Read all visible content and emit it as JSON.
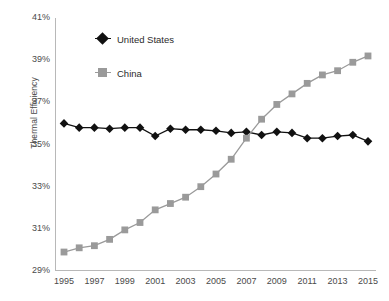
{
  "chart_data": {
    "type": "line",
    "title": "",
    "xlabel": "",
    "ylabel": "Thermal Efficiency",
    "x": [
      1995,
      1996,
      1997,
      1998,
      1999,
      2000,
      2001,
      2002,
      2003,
      2004,
      2005,
      2006,
      2007,
      2008,
      2009,
      2010,
      2011,
      2012,
      2013,
      2014,
      2015
    ],
    "xtick_labels": [
      "1995",
      "1997",
      "1999",
      "2001",
      "2003",
      "2005",
      "2007",
      "2009",
      "2011",
      "2013",
      "2015"
    ],
    "xtick_values": [
      1995,
      1997,
      1999,
      2001,
      2003,
      2005,
      2007,
      2009,
      2011,
      2013,
      2015
    ],
    "ytick_labels": [
      "29%",
      "31%",
      "33%",
      "35%",
      "37%",
      "39%",
      "41%"
    ],
    "ytick_values": [
      29,
      31,
      33,
      35,
      37,
      39,
      41
    ],
    "xlim": [
      1995,
      2015
    ],
    "ylim": [
      29,
      41
    ],
    "grid": false,
    "legend_position": "upper-left-inside",
    "series": [
      {
        "name": "United States",
        "marker": "diamond",
        "color": "#111111",
        "values": [
          36.0,
          35.8,
          35.8,
          35.75,
          35.8,
          35.8,
          35.4,
          35.75,
          35.7,
          35.7,
          35.65,
          35.55,
          35.6,
          35.45,
          35.6,
          35.55,
          35.3,
          35.3,
          35.4,
          35.45,
          35.15
        ]
      },
      {
        "name": "China",
        "marker": "square",
        "color": "#9a9a9a",
        "values": [
          29.9,
          30.1,
          30.2,
          30.5,
          30.95,
          31.3,
          31.9,
          32.2,
          32.5,
          33.0,
          33.6,
          34.3,
          35.3,
          36.2,
          36.9,
          37.4,
          37.9,
          38.3,
          38.5,
          38.9,
          39.2
        ]
      }
    ]
  },
  "legend": {
    "items": [
      {
        "label": "United States",
        "color": "#111111",
        "marker": "diamond"
      },
      {
        "label": "China",
        "color": "#9a9a9a",
        "marker": "square"
      }
    ]
  },
  "axes": {
    "y_title": "Thermal Efficiency",
    "axis_color": "#b8b8b8",
    "tick_text_color": "#4a4a4a"
  }
}
